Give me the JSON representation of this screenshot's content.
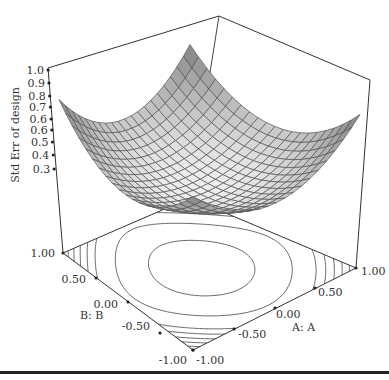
{
  "chart_data": {
    "type": "surface3d",
    "title": "",
    "zlabel": "Std Err of design",
    "xlabel": "A: A",
    "ylabel": "B: B",
    "z_ticks": [
      "1.0",
      "0.9",
      "0.8",
      "0.7",
      "0.6",
      "0.6",
      "0.5",
      "0.4",
      "0.3"
    ],
    "z_tick_values": [
      1.0,
      0.9,
      0.8,
      0.7,
      0.65,
      0.6,
      0.5,
      0.4,
      0.3
    ],
    "x_ticks": [
      "-1.00",
      "-0.50",
      "0.00",
      "0.50",
      "1.00"
    ],
    "y_ticks": [
      "-1.00",
      "-0.50",
      "0.00",
      "0.50",
      "1.00"
    ],
    "xlim": [
      -1,
      1
    ],
    "ylim": [
      -1,
      1
    ],
    "zlim": [
      0.3,
      1.0
    ],
    "surface": {
      "description": "Bowl-shaped standard error surface, minimum ~0.3 near center, ~0.8 at the corners",
      "grid_n": 21,
      "model": "z = 0.30 + 0.125*(A^2 + B^2) + 0.125*(A^2*B^2)*2",
      "corner_values": {
        "A=-1,B=-1": 0.8,
        "A=1,B=-1": 0.8,
        "A=-1,B=1": 0.8,
        "A=1,B=1": 0.8
      },
      "center_value": 0.3
    },
    "contour_levels": [
      0.35,
      0.45,
      0.55,
      0.6,
      0.65,
      0.7,
      0.75
    ],
    "grid": false,
    "legend": "none"
  },
  "labels": {
    "z_axis": "Std Err of design",
    "a_axis": "A: A",
    "b_axis": "B: B"
  }
}
